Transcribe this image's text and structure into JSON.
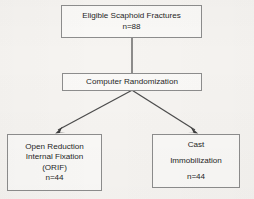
{
  "figure": {
    "type": "flowchart",
    "background_color": "#f6f4f1",
    "box_border_color": "#8d8d8d",
    "box_fill_color": "#faf9f7",
    "connector_color": "#4c4c4c",
    "text_color": "#262626"
  },
  "nodes": {
    "eligible": {
      "line1": "Eligible Scaphoid Fractures",
      "line2": "n=88",
      "count": "88"
    },
    "randomization": {
      "line1": "Computer Randomization"
    },
    "orif": {
      "line1": "Open Reduction",
      "line2": "Internal Fixation",
      "line3": "(ORIF)",
      "line4": "n=44",
      "count": "44"
    },
    "cast": {
      "line1": "Cast",
      "line2": "Immobilization",
      "line3": "n=44",
      "count": "44"
    }
  },
  "connectors": [
    {
      "name": "eligible-to-randomization",
      "from": "eligible",
      "to": "randomization",
      "style": "plain-line"
    },
    {
      "name": "randomization-to-orif",
      "from": "randomization",
      "to": "orif",
      "style": "arrow"
    },
    {
      "name": "randomization-to-cast",
      "from": "randomization",
      "to": "cast",
      "style": "arrow"
    }
  ]
}
